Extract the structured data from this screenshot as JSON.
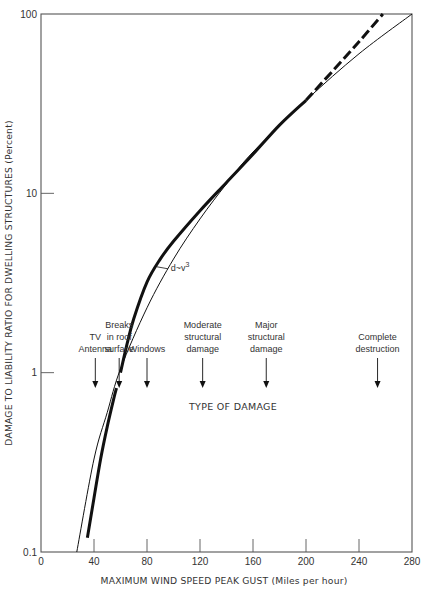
{
  "chart_data": {
    "type": "line",
    "title": "",
    "xlabel": "MAXIMUM WIND SPEED PEAK GUST (Miles per hour)",
    "ylabel": "DAMAGE TO LIABILITY RATIO FOR DWELLING STRUCTURES (Percent)",
    "xlim": [
      0,
      280
    ],
    "ylim": [
      0.1,
      100
    ],
    "yscale": "log",
    "grid": false,
    "x_ticks": [
      "0",
      "40",
      "80",
      "120",
      "160",
      "200",
      "240",
      "280"
    ],
    "x_tick_values": [
      0,
      40,
      80,
      120,
      160,
      200,
      240,
      280
    ],
    "y_ticks": [
      "0.1",
      "1",
      "10",
      "100"
    ],
    "y_tick_values": [
      0.1,
      1,
      10,
      100
    ],
    "series": [
      {
        "name": "d~v^3",
        "style": "thin-solid",
        "x": [
          27,
          40,
          50,
          60,
          80,
          100,
          120,
          140,
          160,
          200,
          240,
          280
        ],
        "y": [
          0.1,
          0.33,
          0.6,
          1.05,
          2.3,
          4.3,
          7.2,
          11.3,
          17,
          33,
          60,
          100
        ]
      },
      {
        "name": "observed damage (lower segment)",
        "style": "thick-solid",
        "x": [
          35,
          40,
          45,
          50,
          55,
          57
        ],
        "y": [
          0.12,
          0.2,
          0.33,
          0.5,
          0.72,
          0.82
        ]
      },
      {
        "name": "observed damage (upper segment)",
        "style": "thick-solid",
        "x": [
          60,
          65,
          70,
          80,
          90,
          100,
          120,
          140,
          160,
          180,
          200
        ],
        "y": [
          1.0,
          1.45,
          2.0,
          3.2,
          4.3,
          5.4,
          8.0,
          11.5,
          16.5,
          24,
          33
        ]
      },
      {
        "name": "observed damage (extrapolated)",
        "style": "thick-dashed",
        "x": [
          200,
          220,
          240,
          258
        ],
        "y": [
          33,
          48,
          70,
          100
        ]
      }
    ],
    "curve_label": {
      "text": "d~v",
      "superscript": "3",
      "at_x": 98,
      "at_y": 3.7
    },
    "annotations_header": "TYPE OF DAMAGE",
    "annotations": [
      {
        "lines": [
          "TV",
          "Antenna"
        ],
        "x": 41
      },
      {
        "lines": [
          "Breaks",
          "in roof",
          "surface"
        ],
        "x": 59
      },
      {
        "lines": [
          "Windows"
        ],
        "x": 80
      },
      {
        "lines": [
          "Moderate",
          "structural",
          "damage"
        ],
        "x": 122
      },
      {
        "lines": [
          "Major",
          "structural",
          "damage"
        ],
        "x": 170
      },
      {
        "lines": [
          "Complete",
          "destruction"
        ],
        "x": 254
      }
    ]
  },
  "colors": {
    "axis": "#555555",
    "curve": "#111111",
    "text": "#333333",
    "background": "#ffffff"
  }
}
